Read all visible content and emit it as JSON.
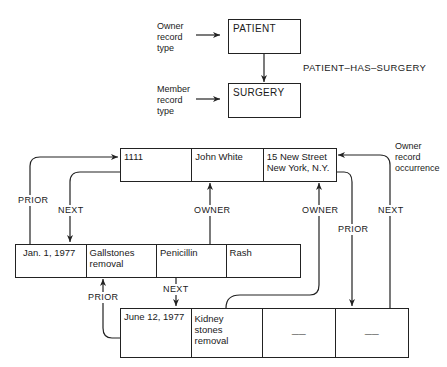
{
  "schema": {
    "owner_label": [
      "Owner",
      "record",
      "type"
    ],
    "member_label": [
      "Member",
      "record",
      "type"
    ],
    "owner_type": "PATIENT",
    "member_type": "SURGERY",
    "set_name": "PATIENT–HAS–SURGERY"
  },
  "owner_occurrence": {
    "label": [
      "Owner",
      "record",
      "occurrence"
    ],
    "fields": [
      "1111",
      "John White",
      "15 New Street\nNew York, N.Y."
    ]
  },
  "member_occurrences": [
    {
      "fields": [
        "Jan. 1, 1977",
        "Gallstones\nremoval",
        "Penicillin",
        "Rash"
      ]
    },
    {
      "fields": [
        "June 12, 1977",
        "Kidney\nstones\nremoval",
        "——",
        "——"
      ]
    }
  ],
  "links": {
    "prior_left": "PRIOR",
    "next_left": "NEXT",
    "owner_mid": "OWNER",
    "owner_right": "OWNER",
    "prior_right": "PRIOR",
    "next_right": "NEXT",
    "prior_between": "PRIOR",
    "next_between": "NEXT"
  }
}
